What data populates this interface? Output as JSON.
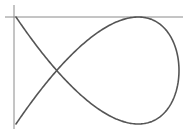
{
  "chart_data": {
    "type": "line",
    "title": "",
    "xlabel": "",
    "ylabel": "",
    "parametric": {
      "x": "sin(2t)",
      "y": "sin(3t + phase)",
      "x_frequency": 2,
      "y_frequency": 3,
      "phase": 0.7854,
      "t_range": [
        0,
        6.2832
      ]
    },
    "grid": false,
    "legend": false,
    "colors": {
      "curve": "#555555",
      "axes": "#8a8a8a",
      "background": "#ffffff"
    },
    "layout": {
      "y_axis_x_px": 14,
      "y_axis_top_px": 5,
      "y_axis_bottom_px": 129,
      "x_axis_y_px": 17,
      "x_axis_left_px": 5,
      "x_axis_right_px": 183,
      "curve_left_px": 16,
      "curve_right_px": 179,
      "curve_top_px": 17,
      "curve_bottom_px": 124
    }
  }
}
